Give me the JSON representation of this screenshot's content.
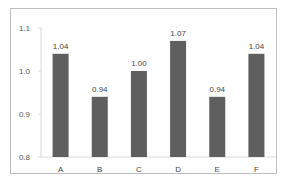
{
  "chart_data": {
    "type": "bar",
    "title": "",
    "xlabel": "",
    "ylabel": "",
    "categories": [
      "A",
      "B",
      "C",
      "D",
      "E",
      "F"
    ],
    "values": [
      1.04,
      0.94,
      1.0,
      1.07,
      0.94,
      1.04
    ],
    "value_labels": [
      "1.04",
      "0.94",
      "1.00",
      "1.07",
      "0.94",
      "1.04"
    ],
    "ylim": [
      0.8,
      1.1
    ],
    "yticks": [
      "0.8",
      "0.9",
      "1.0",
      "1.1"
    ],
    "grid": false,
    "legend": null,
    "bar_color": "#5f5f5f"
  }
}
